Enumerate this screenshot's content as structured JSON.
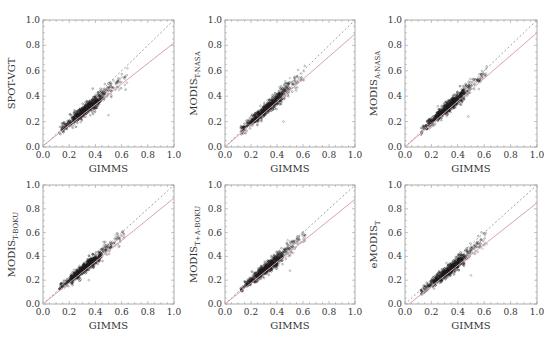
{
  "figure": {
    "rows": 2,
    "cols": 3,
    "colors": {
      "axis": "#9a9a9a",
      "points": "#1a1a1a",
      "fit_line": "#d9a3a8",
      "identity_line": "#a0a0a0",
      "text": "#333333"
    }
  },
  "chart_data": [
    {
      "type": "scatter",
      "title": "",
      "xlabel": "GIMMS",
      "ylabel": "SPOT-VGT",
      "ylabel_main": "SPOT-VGT",
      "ylabel_sub": "",
      "xlim": [
        0.0,
        1.0
      ],
      "ylim": [
        0.0,
        1.0
      ],
      "xticks": [
        "0.0",
        "0.2",
        "0.4",
        "0.6",
        "0.8",
        "1.0"
      ],
      "yticks": [
        "0.0",
        "0.2",
        "0.4",
        "0.6",
        "0.8",
        "1.0"
      ],
      "grid": false,
      "identity_line": {
        "style": "dotted",
        "from": [
          0,
          0
        ],
        "to": [
          1,
          1
        ]
      },
      "fit_line": {
        "style": "solid",
        "from": [
          0.0,
          0.01
        ],
        "to": [
          1.0,
          0.82
        ]
      },
      "points_summary": {
        "x_range": [
          0.12,
          0.65
        ],
        "y_range": [
          0.12,
          0.58
        ],
        "outliers": [
          [
            0.5,
            0.25
          ]
        ]
      }
    },
    {
      "type": "scatter",
      "title": "",
      "xlabel": "GIMMS",
      "ylabel": "MODIS T-NASA",
      "ylabel_main": "MODIS",
      "ylabel_sub": "T-NASA",
      "xlim": [
        0.0,
        1.0
      ],
      "ylim": [
        0.0,
        1.0
      ],
      "xticks": [
        "0.0",
        "0.2",
        "0.4",
        "0.6",
        "0.8",
        "1.0"
      ],
      "yticks": [
        "0.0",
        "0.2",
        "0.4",
        "0.6",
        "0.8",
        "1.0"
      ],
      "grid": false,
      "identity_line": {
        "style": "dotted",
        "from": [
          0,
          0
        ],
        "to": [
          1,
          1
        ]
      },
      "fit_line": {
        "style": "solid",
        "from": [
          0.0,
          0.0
        ],
        "to": [
          1.0,
          0.89
        ]
      },
      "points_summary": {
        "x_range": [
          0.12,
          0.62
        ],
        "y_range": [
          0.12,
          0.6
        ],
        "outliers": [
          [
            0.45,
            0.2
          ]
        ]
      }
    },
    {
      "type": "scatter",
      "title": "",
      "xlabel": "GIMMS",
      "ylabel": "MODIS A-NASA",
      "ylabel_main": "MODIS",
      "ylabel_sub": "A-NASA",
      "xlim": [
        0.0,
        1.0
      ],
      "ylim": [
        0.0,
        1.0
      ],
      "xticks": [
        "0.0",
        "0.2",
        "0.4",
        "0.6",
        "0.8",
        "1.0"
      ],
      "yticks": [
        "0.0",
        "0.2",
        "0.4",
        "0.6",
        "0.8",
        "1.0"
      ],
      "grid": false,
      "identity_line": {
        "style": "dotted",
        "from": [
          0,
          0
        ],
        "to": [
          1,
          1
        ]
      },
      "fit_line": {
        "style": "solid",
        "from": [
          0.0,
          0.0
        ],
        "to": [
          1.0,
          0.9
        ]
      },
      "points_summary": {
        "x_range": [
          0.12,
          0.62
        ],
        "y_range": [
          0.12,
          0.6
        ],
        "outliers": [
          [
            0.48,
            0.24
          ]
        ]
      }
    },
    {
      "type": "scatter",
      "title": "",
      "xlabel": "GIMMS",
      "ylabel": "MODIS T-BOKU",
      "ylabel_main": "MODIS",
      "ylabel_sub": "T-BOKU",
      "xlim": [
        0.0,
        1.0
      ],
      "ylim": [
        0.0,
        1.0
      ],
      "xticks": [
        "0.0",
        "0.2",
        "0.4",
        "0.6",
        "0.8",
        "1.0"
      ],
      "yticks": [
        "0.0",
        "0.2",
        "0.4",
        "0.6",
        "0.8",
        "1.0"
      ],
      "grid": false,
      "identity_line": {
        "style": "dotted",
        "from": [
          0,
          0
        ],
        "to": [
          1,
          1
        ]
      },
      "fit_line": {
        "style": "solid",
        "from": [
          0.0,
          0.0
        ],
        "to": [
          1.0,
          0.89
        ]
      },
      "points_summary": {
        "x_range": [
          0.12,
          0.62
        ],
        "y_range": [
          0.12,
          0.6
        ],
        "outliers": [
          [
            0.35,
            0.2
          ]
        ]
      }
    },
    {
      "type": "scatter",
      "title": "",
      "xlabel": "GIMMS",
      "ylabel": "MODIS T+A-BOKU",
      "ylabel_main": "MODIS",
      "ylabel_sub": "T+A-BOKU",
      "xlim": [
        0.0,
        1.0
      ],
      "ylim": [
        0.0,
        1.0
      ],
      "xticks": [
        "0.0",
        "0.2",
        "0.4",
        "0.6",
        "0.8",
        "1.0"
      ],
      "yticks": [
        "0.0",
        "0.2",
        "0.4",
        "0.6",
        "0.8",
        "1.0"
      ],
      "grid": false,
      "identity_line": {
        "style": "dotted",
        "from": [
          0,
          0
        ],
        "to": [
          1,
          1
        ]
      },
      "fit_line": {
        "style": "solid",
        "from": [
          0.0,
          0.0
        ],
        "to": [
          1.0,
          0.88
        ]
      },
      "points_summary": {
        "x_range": [
          0.12,
          0.62
        ],
        "y_range": [
          0.12,
          0.6
        ],
        "outliers": [
          [
            0.5,
            0.28
          ]
        ]
      }
    },
    {
      "type": "scatter",
      "title": "",
      "xlabel": "GIMMS",
      "ylabel": "eMODIS T",
      "ylabel_main": "eMODIS",
      "ylabel_sub": "T",
      "xlim": [
        0.0,
        1.0
      ],
      "ylim": [
        0.0,
        1.0
      ],
      "xticks": [
        "0.0",
        "0.2",
        "0.4",
        "0.6",
        "0.8",
        "1.0"
      ],
      "yticks": [
        "0.0",
        "0.2",
        "0.4",
        "0.6",
        "0.8",
        "1.0"
      ],
      "grid": false,
      "identity_line": {
        "style": "dotted",
        "from": [
          0,
          0
        ],
        "to": [
          1,
          1
        ]
      },
      "fit_line": {
        "style": "solid",
        "from": [
          0.03,
          0.0
        ],
        "to": [
          1.0,
          0.85
        ]
      },
      "points_summary": {
        "x_range": [
          0.12,
          0.62
        ],
        "y_range": [
          0.12,
          0.58
        ],
        "outliers": [
          [
            0.5,
            0.24
          ]
        ]
      }
    }
  ]
}
